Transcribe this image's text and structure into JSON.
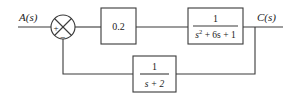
{
  "diagram": {
    "type": "block-diagram",
    "input": {
      "label": "A(s)"
    },
    "output": {
      "label": "C(s)"
    },
    "summing_junction": {
      "plus_sign": "+",
      "minus_sign": "−"
    },
    "forward_blocks": [
      {
        "id": "gain",
        "numerator": "0.2"
      },
      {
        "id": "plant",
        "numerator": "1",
        "denominator_text": "s² + 6s + 1",
        "den_s": "s",
        "den_exp": "2",
        "den_rest": " + 6s + 1"
      }
    ],
    "feedback_block": {
      "numerator": "1",
      "denominator": "s + 2"
    }
  }
}
